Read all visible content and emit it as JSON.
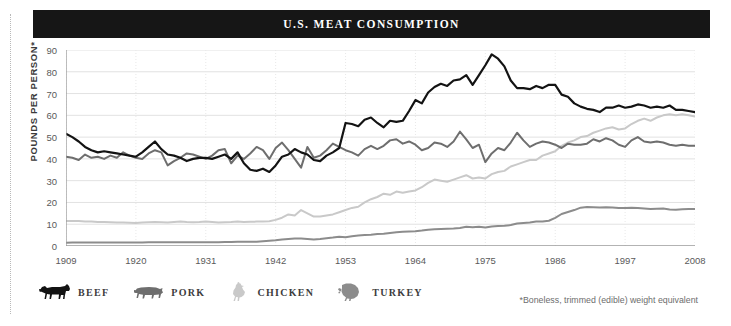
{
  "header": {
    "title": "U.S. MEAT CONSUMPTION"
  },
  "footnote": "*Boneless, trimmed (edible) weight equivalent",
  "axes": {
    "ylabel": "POUNDS PER PERSON*",
    "yticks": [
      "0",
      "10",
      "20",
      "30",
      "40",
      "50",
      "60",
      "70",
      "80",
      "90"
    ],
    "xticks": [
      "1909",
      "1920",
      "1931",
      "1942",
      "1953",
      "1964",
      "1975",
      "1986",
      "1997",
      "2008"
    ]
  },
  "legend": {
    "items": [
      {
        "label": "BEEF",
        "icon": "cow-icon",
        "color": "#131313"
      },
      {
        "label": "PORK",
        "icon": "pig-icon",
        "color": "#6e6e6e"
      },
      {
        "label": "CHICKEN",
        "icon": "chicken-icon",
        "color": "#c9c9c9"
      },
      {
        "label": "TURKEY",
        "icon": "turkey-icon",
        "color": "#8c8c8c"
      }
    ]
  },
  "colors": {
    "beef": "#131313",
    "pork": "#6e6e6e",
    "chicken": "#c9c9c9",
    "turkey": "#8c8c8c",
    "grid": "#e2e2e2",
    "axis": "#9a9a9a",
    "title_bar": "#161616",
    "background": "#ffffff"
  },
  "chart_data": {
    "type": "line",
    "title": "U.S. MEAT CONSUMPTION",
    "xlabel": "",
    "ylabel": "POUNDS PER PERSON*",
    "xlim": [
      1909,
      2008
    ],
    "ylim": [
      0,
      90
    ],
    "ytick_step": 10,
    "grid": true,
    "legend_position": "below-left",
    "annotation": "*Boneless, trimmed (edible) weight equivalent",
    "x": [
      1909,
      1910,
      1911,
      1912,
      1913,
      1914,
      1915,
      1916,
      1917,
      1918,
      1919,
      1920,
      1921,
      1922,
      1923,
      1924,
      1925,
      1926,
      1927,
      1928,
      1929,
      1930,
      1931,
      1932,
      1933,
      1934,
      1935,
      1936,
      1937,
      1938,
      1939,
      1940,
      1941,
      1942,
      1943,
      1944,
      1945,
      1946,
      1947,
      1948,
      1949,
      1950,
      1951,
      1952,
      1953,
      1954,
      1955,
      1956,
      1957,
      1958,
      1959,
      1960,
      1961,
      1962,
      1963,
      1964,
      1965,
      1966,
      1967,
      1968,
      1969,
      1970,
      1971,
      1972,
      1973,
      1974,
      1975,
      1976,
      1977,
      1978,
      1979,
      1980,
      1981,
      1982,
      1983,
      1984,
      1985,
      1986,
      1987,
      1988,
      1989,
      1990,
      1991,
      1992,
      1993,
      1994,
      1995,
      1996,
      1997,
      1998,
      1999,
      2000,
      2001,
      2002,
      2003,
      2004,
      2005,
      2006,
      2007,
      2008
    ],
    "series": [
      {
        "name": "BEEF",
        "color": "#131313",
        "values": [
          51.5,
          50.0,
          48.0,
          45.5,
          44.0,
          43.0,
          43.5,
          43.0,
          42.5,
          42.0,
          41.5,
          41.0,
          43.0,
          45.5,
          48.0,
          44.5,
          42.0,
          41.5,
          40.5,
          39.0,
          40.0,
          40.5,
          40.5,
          40.0,
          41.0,
          42.0,
          40.0,
          43.0,
          38.0,
          35.0,
          34.5,
          35.5,
          34.0,
          37.0,
          41.0,
          42.0,
          44.5,
          43.0,
          42.0,
          39.5,
          39.0,
          41.5,
          43.0,
          45.0,
          56.5,
          56.0,
          55.0,
          58.0,
          59.0,
          56.5,
          54.5,
          57.5,
          57.0,
          57.5,
          62.0,
          67.0,
          65.5,
          70.5,
          73.0,
          74.5,
          73.5,
          76.0,
          76.5,
          78.5,
          74.0,
          78.5,
          83.0,
          88.0,
          86.0,
          82.5,
          76.0,
          72.5,
          72.5,
          72.0,
          73.5,
          72.5,
          74.0,
          74.0,
          69.5,
          68.5,
          65.5,
          64.0,
          63.0,
          62.5,
          61.5,
          63.5,
          63.5,
          64.5,
          63.5,
          64.0,
          65.0,
          64.5,
          63.5,
          64.0,
          63.5,
          64.5,
          62.5,
          62.5,
          62.0,
          61.5
        ]
      },
      {
        "name": "PORK",
        "color": "#6e6e6e",
        "values": [
          41.0,
          40.5,
          39.5,
          42.0,
          40.5,
          41.0,
          40.0,
          41.5,
          40.5,
          43.0,
          41.5,
          40.5,
          40.0,
          42.5,
          44.0,
          43.0,
          37.0,
          39.0,
          40.5,
          42.5,
          42.0,
          41.0,
          40.0,
          41.5,
          44.0,
          44.5,
          38.0,
          41.5,
          40.0,
          42.5,
          45.5,
          44.0,
          40.0,
          45.0,
          47.5,
          44.0,
          40.0,
          36.0,
          45.5,
          40.5,
          41.5,
          44.0,
          47.0,
          45.5,
          44.0,
          43.0,
          41.5,
          44.5,
          46.0,
          44.5,
          46.0,
          48.5,
          49.0,
          47.0,
          48.0,
          46.5,
          44.0,
          45.0,
          47.5,
          47.0,
          45.5,
          48.0,
          52.5,
          49.0,
          45.0,
          46.5,
          38.5,
          42.5,
          45.0,
          44.0,
          47.5,
          52.0,
          48.5,
          45.5,
          47.0,
          48.0,
          47.5,
          46.5,
          45.0,
          47.0,
          46.5,
          46.5,
          47.0,
          49.0,
          48.0,
          49.5,
          48.5,
          46.5,
          45.5,
          48.5,
          50.0,
          48.0,
          47.5,
          48.0,
          47.5,
          46.5,
          46.0,
          46.5,
          46.0,
          46.0
        ]
      },
      {
        "name": "CHICKEN",
        "color": "#c9c9c9",
        "values": [
          11.5,
          11.5,
          11.5,
          11.3,
          11.2,
          11.0,
          11.0,
          10.9,
          10.8,
          10.8,
          10.7,
          10.6,
          10.8,
          10.9,
          11.0,
          10.9,
          10.8,
          11.0,
          11.2,
          11.0,
          10.9,
          11.0,
          11.2,
          11.0,
          10.8,
          10.9,
          11.0,
          11.2,
          11.0,
          11.1,
          11.2,
          11.3,
          11.4,
          12.0,
          13.0,
          14.5,
          14.0,
          16.5,
          15.0,
          13.5,
          13.5,
          14.0,
          14.5,
          15.5,
          16.5,
          17.5,
          18.0,
          20.0,
          21.5,
          22.5,
          24.0,
          23.5,
          25.0,
          24.5,
          25.0,
          25.5,
          27.0,
          29.0,
          30.5,
          30.0,
          29.5,
          30.5,
          31.5,
          32.5,
          31.0,
          31.5,
          31.0,
          33.0,
          34.0,
          34.5,
          36.5,
          37.5,
          38.5,
          39.5,
          39.5,
          41.5,
          42.5,
          43.5,
          46.0,
          47.5,
          48.5,
          50.0,
          50.5,
          52.0,
          53.0,
          54.0,
          54.5,
          53.5,
          54.0,
          56.0,
          57.5,
          58.5,
          57.5,
          59.0,
          60.0,
          60.5,
          60.0,
          60.5,
          60.0,
          59.5
        ]
      },
      {
        "name": "TURKEY",
        "color": "#8c8c8c",
        "values": [
          1.5,
          1.6,
          1.6,
          1.6,
          1.6,
          1.6,
          1.6,
          1.6,
          1.6,
          1.6,
          1.6,
          1.6,
          1.6,
          1.7,
          1.7,
          1.7,
          1.7,
          1.7,
          1.7,
          1.7,
          1.7,
          1.7,
          1.7,
          1.7,
          1.7,
          1.8,
          1.8,
          1.9,
          1.9,
          2.0,
          2.0,
          2.2,
          2.4,
          2.6,
          3.0,
          3.2,
          3.4,
          3.4,
          3.2,
          3.0,
          3.2,
          3.6,
          3.9,
          4.3,
          4.0,
          4.5,
          4.8,
          5.0,
          5.2,
          5.5,
          5.6,
          6.0,
          6.3,
          6.5,
          6.7,
          6.8,
          7.1,
          7.5,
          7.7,
          7.8,
          7.9,
          8.0,
          8.3,
          8.8,
          8.6,
          8.8,
          8.5,
          9.0,
          9.2,
          9.3,
          9.6,
          10.3,
          10.6,
          10.8,
          11.2,
          11.2,
          11.6,
          12.9,
          14.7,
          15.6,
          16.5,
          17.6,
          17.9,
          17.8,
          17.7,
          17.8,
          17.7,
          17.4,
          17.4,
          17.6,
          17.4,
          17.2,
          17.0,
          17.1,
          17.2,
          16.8,
          16.7,
          16.9,
          17.0,
          17.0
        ]
      }
    ]
  }
}
